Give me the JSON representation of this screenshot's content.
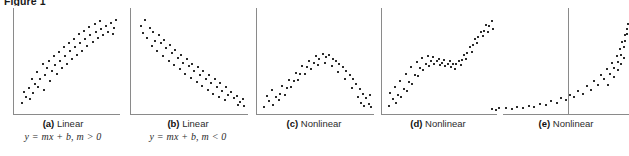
{
  "figure": {
    "title": "Figure 1",
    "kind": "scatterplot-panels"
  },
  "panels": [
    {
      "id": "a",
      "label": "(a)",
      "name": "Linear",
      "equation": "y = mx + b, m > 0",
      "caption_full": "(a) Linear  y = mx + b, m > 0"
    },
    {
      "id": "b",
      "label": "(b)",
      "name": "Linear",
      "equation": "y = mx + b, m < 0",
      "caption_full": "(b) Linear  y = mx + b, m < 0"
    },
    {
      "id": "c",
      "label": "(c)",
      "name": "Nonlinear",
      "equation": "",
      "caption_full": "(c) Nonlinear"
    },
    {
      "id": "d",
      "label": "(d)",
      "name": "Nonlinear",
      "equation": "",
      "caption_full": "(d) Nonlinear"
    },
    {
      "id": "e",
      "label": "(e)",
      "name": "Nonlinear",
      "equation": "",
      "caption_full": "(e) Nonlinear"
    }
  ],
  "colors": {
    "dot": "#2b2b2b",
    "axis": "#8a8a8a",
    "text": "#2b2b2b",
    "background": "#ffffff"
  },
  "chart_data": [
    {
      "type": "scatter",
      "title": "(a) Linear",
      "annotation": "y = mx + b, m > 0",
      "xlabel": "",
      "ylabel": "",
      "grid": false,
      "legend": "none",
      "xlim": [
        0,
        100
      ],
      "ylim": [
        0,
        100
      ],
      "points": [
        [
          4,
          8
        ],
        [
          8,
          14
        ],
        [
          6,
          20
        ],
        [
          12,
          12
        ],
        [
          11,
          24
        ],
        [
          15,
          19
        ],
        [
          17,
          28
        ],
        [
          14,
          33
        ],
        [
          20,
          25
        ],
        [
          22,
          33
        ],
        [
          19,
          40
        ],
        [
          25,
          22
        ],
        [
          26,
          37
        ],
        [
          28,
          44
        ],
        [
          24,
          48
        ],
        [
          31,
          31
        ],
        [
          33,
          41
        ],
        [
          30,
          52
        ],
        [
          36,
          47
        ],
        [
          38,
          38
        ],
        [
          35,
          57
        ],
        [
          41,
          52
        ],
        [
          43,
          44
        ],
        [
          40,
          61
        ],
        [
          46,
          57
        ],
        [
          48,
          49
        ],
        [
          45,
          66
        ],
        [
          51,
          62
        ],
        [
          53,
          54
        ],
        [
          50,
          70
        ],
        [
          56,
          66
        ],
        [
          58,
          58
        ],
        [
          55,
          74
        ],
        [
          61,
          70
        ],
        [
          63,
          62
        ],
        [
          60,
          79
        ],
        [
          66,
          74
        ],
        [
          68,
          67
        ],
        [
          65,
          83
        ],
        [
          71,
          78
        ],
        [
          73,
          71
        ],
        [
          70,
          87
        ],
        [
          76,
          82
        ],
        [
          78,
          75
        ],
        [
          75,
          90
        ],
        [
          81,
          85
        ],
        [
          83,
          78
        ],
        [
          80,
          93
        ],
        [
          86,
          88
        ],
        [
          88,
          82
        ],
        [
          91,
          91
        ],
        [
          94,
          86
        ],
        [
          96,
          94
        ],
        [
          93,
          79
        ]
      ]
    },
    {
      "type": "scatter",
      "title": "(b) Linear",
      "annotation": "y = mx + b, m < 0",
      "xlabel": "",
      "ylabel": "",
      "grid": false,
      "legend": "none",
      "xlim": [
        0,
        100
      ],
      "ylim": [
        0,
        100
      ],
      "points": [
        [
          5,
          88
        ],
        [
          9,
          94
        ],
        [
          7,
          80
        ],
        [
          13,
          86
        ],
        [
          11,
          75
        ],
        [
          16,
          81
        ],
        [
          18,
          72
        ],
        [
          15,
          67
        ],
        [
          21,
          78
        ],
        [
          23,
          70
        ],
        [
          20,
          62
        ],
        [
          26,
          73
        ],
        [
          28,
          65
        ],
        [
          25,
          57
        ],
        [
          31,
          68
        ],
        [
          33,
          60
        ],
        [
          30,
          52
        ],
        [
          36,
          63
        ],
        [
          38,
          55
        ],
        [
          35,
          47
        ],
        [
          41,
          58
        ],
        [
          43,
          50
        ],
        [
          40,
          43
        ],
        [
          46,
          54
        ],
        [
          48,
          46
        ],
        [
          45,
          38
        ],
        [
          51,
          49
        ],
        [
          53,
          41
        ],
        [
          50,
          34
        ],
        [
          56,
          45
        ],
        [
          58,
          37
        ],
        [
          55,
          30
        ],
        [
          61,
          41
        ],
        [
          63,
          33
        ],
        [
          60,
          26
        ],
        [
          66,
          37
        ],
        [
          68,
          29
        ],
        [
          65,
          22
        ],
        [
          71,
          33
        ],
        [
          73,
          25
        ],
        [
          70,
          18
        ],
        [
          76,
          29
        ],
        [
          78,
          21
        ],
        [
          75,
          15
        ],
        [
          81,
          25
        ],
        [
          83,
          17
        ],
        [
          80,
          11
        ],
        [
          86,
          20
        ],
        [
          88,
          13
        ],
        [
          91,
          16
        ],
        [
          94,
          9
        ],
        [
          96,
          12
        ],
        [
          92,
          6
        ],
        [
          97,
          5
        ]
      ]
    },
    {
      "type": "scatter",
      "title": "(c) Nonlinear",
      "annotation": "",
      "shape": "inverted-u / downward parabola",
      "xlabel": "",
      "ylabel": "",
      "grid": false,
      "legend": "none",
      "xlim": [
        0,
        100
      ],
      "ylim": [
        0,
        100
      ],
      "points": [
        [
          3,
          4
        ],
        [
          7,
          10
        ],
        [
          5,
          16
        ],
        [
          11,
          6
        ],
        [
          13,
          14
        ],
        [
          10,
          22
        ],
        [
          17,
          18
        ],
        [
          19,
          26
        ],
        [
          16,
          11
        ],
        [
          23,
          24
        ],
        [
          25,
          32
        ],
        [
          21,
          17
        ],
        [
          29,
          31
        ],
        [
          31,
          39
        ],
        [
          27,
          25
        ],
        [
          35,
          38
        ],
        [
          37,
          46
        ],
        [
          33,
          32
        ],
        [
          41,
          45
        ],
        [
          43,
          52
        ],
        [
          39,
          38
        ],
        [
          47,
          50
        ],
        [
          49,
          57
        ],
        [
          45,
          43
        ],
        [
          52,
          54
        ],
        [
          55,
          59
        ],
        [
          51,
          47
        ],
        [
          58,
          56
        ],
        [
          61,
          58
        ],
        [
          57,
          50
        ],
        [
          64,
          54
        ],
        [
          67,
          52
        ],
        [
          63,
          46
        ],
        [
          70,
          49
        ],
        [
          73,
          45
        ],
        [
          69,
          40
        ],
        [
          76,
          41
        ],
        [
          79,
          37
        ],
        [
          75,
          33
        ],
        [
          82,
          33
        ],
        [
          85,
          28
        ],
        [
          81,
          24
        ],
        [
          88,
          23
        ],
        [
          91,
          18
        ],
        [
          87,
          14
        ],
        [
          94,
          13
        ],
        [
          96,
          7
        ],
        [
          92,
          5
        ],
        [
          97,
          17
        ],
        [
          98,
          4
        ],
        [
          89,
          8
        ]
      ]
    },
    {
      "type": "scatter",
      "title": "(d) Nonlinear",
      "annotation": "",
      "shape": "s-curve / cubic",
      "xlabel": "",
      "ylabel": "",
      "grid": false,
      "legend": "none",
      "xlim": [
        0,
        100
      ],
      "ylim": [
        0,
        100
      ],
      "points": [
        [
          3,
          5
        ],
        [
          6,
          12
        ],
        [
          4,
          19
        ],
        [
          9,
          8
        ],
        [
          11,
          17
        ],
        [
          8,
          25
        ],
        [
          14,
          14
        ],
        [
          16,
          23
        ],
        [
          13,
          31
        ],
        [
          19,
          21
        ],
        [
          21,
          30
        ],
        [
          18,
          38
        ],
        [
          24,
          28
        ],
        [
          26,
          37
        ],
        [
          23,
          45
        ],
        [
          29,
          36
        ],
        [
          31,
          44
        ],
        [
          28,
          51
        ],
        [
          34,
          42
        ],
        [
          36,
          49
        ],
        [
          33,
          55
        ],
        [
          39,
          46
        ],
        [
          41,
          52
        ],
        [
          38,
          57
        ],
        [
          44,
          48
        ],
        [
          46,
          52
        ],
        [
          43,
          56
        ],
        [
          49,
          47
        ],
        [
          51,
          50
        ],
        [
          48,
          54
        ],
        [
          54,
          46
        ],
        [
          56,
          49
        ],
        [
          53,
          53
        ],
        [
          59,
          45
        ],
        [
          61,
          48
        ],
        [
          58,
          52
        ],
        [
          64,
          48
        ],
        [
          66,
          52
        ],
        [
          63,
          43
        ],
        [
          69,
          53
        ],
        [
          71,
          58
        ],
        [
          68,
          47
        ],
        [
          74,
          60
        ],
        [
          76,
          66
        ],
        [
          73,
          54
        ],
        [
          79,
          68
        ],
        [
          81,
          74
        ],
        [
          78,
          61
        ],
        [
          84,
          76
        ],
        [
          86,
          82
        ],
        [
          83,
          70
        ],
        [
          89,
          83
        ],
        [
          91,
          89
        ],
        [
          88,
          77
        ],
        [
          94,
          88
        ],
        [
          96,
          93
        ],
        [
          93,
          81
        ],
        [
          97,
          85
        ]
      ]
    },
    {
      "type": "scatter",
      "title": "(e) Nonlinear",
      "annotation": "",
      "shape": "exponential / j-curve",
      "xlabel": "",
      "ylabel": "",
      "grid": false,
      "legend": "none",
      "xlim": [
        0,
        100
      ],
      "ylim": [
        0,
        100
      ],
      "points": [
        [
          4,
          2
        ],
        [
          9,
          3
        ],
        [
          7,
          1
        ],
        [
          14,
          3
        ],
        [
          18,
          2
        ],
        [
          22,
          4
        ],
        [
          26,
          3
        ],
        [
          30,
          5
        ],
        [
          34,
          4
        ],
        [
          38,
          7
        ],
        [
          42,
          6
        ],
        [
          46,
          10
        ],
        [
          50,
          8
        ],
        [
          53,
          13
        ],
        [
          56,
          11
        ],
        [
          59,
          17
        ],
        [
          62,
          14
        ],
        [
          65,
          21
        ],
        [
          68,
          18
        ],
        [
          71,
          26
        ],
        [
          74,
          22
        ],
        [
          76,
          31
        ],
        [
          79,
          27
        ],
        [
          81,
          37
        ],
        [
          83,
          33
        ],
        [
          85,
          43
        ],
        [
          87,
          38
        ],
        [
          89,
          50
        ],
        [
          90,
          44
        ],
        [
          92,
          57
        ],
        [
          93,
          51
        ],
        [
          94,
          64
        ],
        [
          95,
          58
        ],
        [
          96,
          71
        ],
        [
          97,
          66
        ],
        [
          98,
          78
        ],
        [
          98,
          72
        ],
        [
          99,
          85
        ],
        [
          99,
          79
        ],
        [
          100,
          90
        ],
        [
          86,
          27
        ],
        [
          90,
          35
        ],
        [
          93,
          42
        ],
        [
          95,
          48
        ],
        [
          97,
          55
        ]
      ]
    }
  ]
}
